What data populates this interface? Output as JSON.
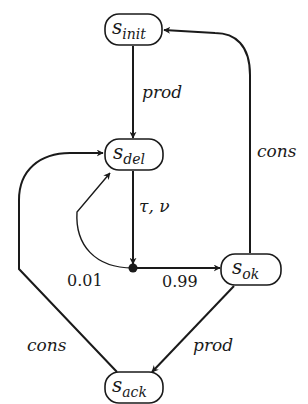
{
  "diagram": {
    "type": "state-transition",
    "nodes": [
      {
        "id": "s_init",
        "main": "s",
        "sub": "init"
      },
      {
        "id": "s_del",
        "main": "s",
        "sub": "del"
      },
      {
        "id": "s_ok",
        "main": "s",
        "sub": "ok"
      },
      {
        "id": "s_ack",
        "main": "s",
        "sub": "ack"
      }
    ],
    "edges": [
      {
        "from": "s_init",
        "to": "s_del",
        "label": "prod"
      },
      {
        "from": "s_del",
        "to": "branch",
        "label": "τ, ν"
      },
      {
        "from": "branch",
        "to": "s_del",
        "label": "0.01"
      },
      {
        "from": "branch",
        "to": "s_ok",
        "label": "0.99"
      },
      {
        "from": "s_ok",
        "to": "s_init",
        "label": "cons"
      },
      {
        "from": "s_ok",
        "to": "s_ack",
        "label": "prod"
      },
      {
        "from": "s_ack",
        "to": "s_del",
        "label": "cons"
      }
    ]
  }
}
